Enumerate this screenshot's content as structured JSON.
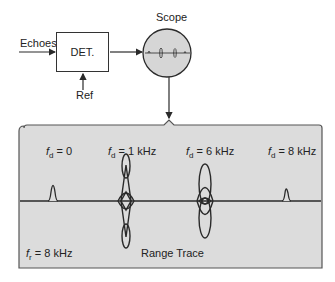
{
  "block_diagram": {
    "input_label": "Echoes",
    "detector_label": "DET.",
    "reference_label": "Ref",
    "scope_label": "Scope"
  },
  "range_trace_panel": {
    "title": "Range Trace",
    "prf_label": {
      "symbol": "f",
      "subscript": "r",
      "value": "= 8 kHz"
    },
    "targets": [
      {
        "symbol": "f",
        "subscript": "d",
        "value": "= 0",
        "type": "steady-pulse"
      },
      {
        "symbol": "f",
        "subscript": "d",
        "value": "= 1 kHz",
        "type": "butterfly-bipolar"
      },
      {
        "symbol": "f",
        "subscript": "d",
        "value": "= 6 kHz",
        "type": "butterfly-bipolar"
      },
      {
        "symbol": "f",
        "subscript": "d",
        "value": "= 8 kHz",
        "type": "steady-pulse"
      }
    ]
  },
  "colors": {
    "panel_fill": "#dcdcdc",
    "scope_fill": "#d6d6d6",
    "line": "#2a2a2a"
  }
}
